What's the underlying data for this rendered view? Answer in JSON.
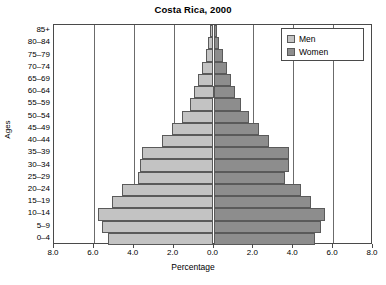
{
  "chart_data": {
    "type": "bar",
    "subtype": "population-pyramid",
    "title": "Costa Rica, 2000",
    "xlabel": "Percentage",
    "ylabel": "Ages",
    "xlim": [
      -8.0,
      8.0
    ],
    "xticks": [
      "8.0",
      "6.0",
      "4.0",
      "2.0",
      "0.0",
      "2.0",
      "4.0",
      "6.0",
      "8.0"
    ],
    "xtick_values": [
      -8.0,
      -6.0,
      -4.0,
      -2.0,
      0.0,
      2.0,
      4.0,
      6.0,
      8.0
    ],
    "grid": true,
    "legend_position": "top-right",
    "categories": [
      "85+",
      "80–84",
      "75–79",
      "70–74",
      "65–69",
      "60–64",
      "55–59",
      "50–54",
      "45–49",
      "40–44",
      "35–39",
      "30–34",
      "25–29",
      "20–24",
      "15–19",
      "10–14",
      "5–9",
      "0–4"
    ],
    "series": [
      {
        "name": "Men",
        "color": "#c3c3c3",
        "side": "left",
        "values": [
          0.2,
          0.3,
          0.4,
          0.6,
          0.8,
          1.0,
          1.2,
          1.6,
          2.1,
          2.6,
          3.6,
          3.7,
          3.8,
          4.6,
          5.1,
          5.8,
          5.6,
          5.3
        ]
      },
      {
        "name": "Women",
        "color": "#8d8d8d",
        "side": "right",
        "values": [
          0.2,
          0.3,
          0.5,
          0.7,
          0.9,
          1.1,
          1.4,
          1.8,
          2.3,
          2.8,
          3.8,
          3.8,
          3.6,
          4.4,
          4.9,
          5.6,
          5.4,
          5.1
        ]
      }
    ]
  },
  "legend": {
    "men_label": "Men",
    "women_label": "Women"
  }
}
